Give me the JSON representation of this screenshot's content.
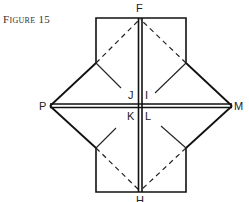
{
  "caption": "Figure 15",
  "labels": {
    "F": "F",
    "P": "P",
    "M": "M",
    "J": "J",
    "I": "I",
    "K": "K",
    "L": "L",
    "H": "H"
  }
}
